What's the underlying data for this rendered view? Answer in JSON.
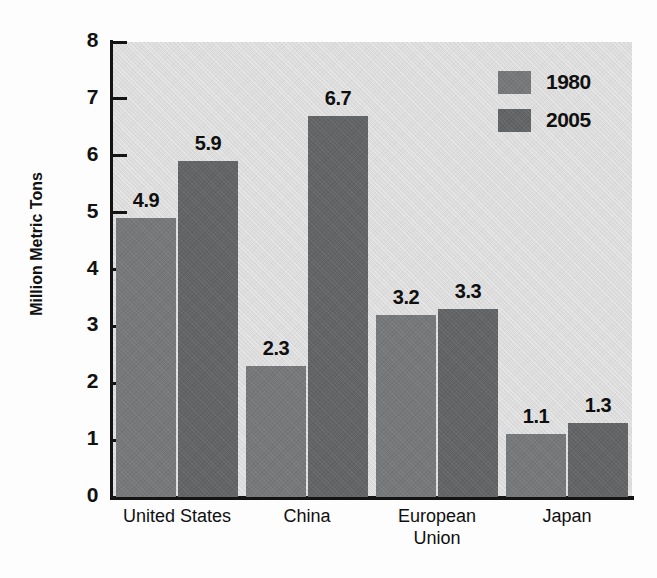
{
  "chart_data": {
    "type": "bar",
    "title": "",
    "xlabel": "",
    "ylabel": "Million Metric Tons",
    "ylim": [
      0,
      8
    ],
    "ytick_labels": [
      "8",
      "7",
      "6",
      "5",
      "4",
      "3",
      "2",
      "1",
      "0"
    ],
    "ytick_values": [
      8,
      7,
      6,
      5,
      4,
      3,
      2,
      1,
      0
    ],
    "grid": false,
    "legend_position": "top-right",
    "categories": [
      "United States",
      "China",
      "European\nUnion",
      "Japan"
    ],
    "series": [
      {
        "name": "1980",
        "color": "#77787a",
        "values": [
          4.9,
          2.3,
          3.2,
          1.1
        ],
        "labels": [
          "4.9",
          "2.3",
          "3.2",
          "1.1"
        ]
      },
      {
        "name": "2005",
        "color": "#636466",
        "values": [
          5.9,
          6.7,
          3.3,
          1.3
        ],
        "labels": [
          "5.9",
          "6.7",
          "3.3",
          "1.3"
        ]
      }
    ]
  },
  "legend": {
    "entries": [
      {
        "label": "1980",
        "color": "#77787a"
      },
      {
        "label": "2005",
        "color": "#636466"
      }
    ]
  },
  "colors": {
    "plot_background": "#dcdcdc",
    "page_background": "#fdfdfd",
    "axis": "#141414",
    "text": "#111111",
    "series_1980": "#77787a",
    "series_2005": "#636466"
  }
}
